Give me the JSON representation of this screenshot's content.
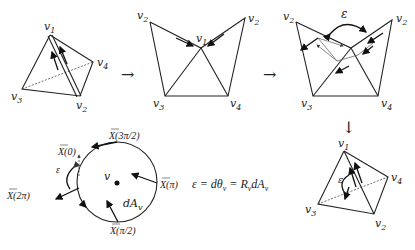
{
  "diagram": {
    "stage1_tetrahedron": {
      "vertices": [
        "v1",
        "v2",
        "v3",
        "v4"
      ],
      "labels": {
        "v1": "v",
        "v2": "v",
        "v3": "v",
        "v4": "v"
      },
      "subs": {
        "v1": "1",
        "v2": "2",
        "v3": "3",
        "v4": "4"
      }
    },
    "stage2_unfolded": {
      "labels": {
        "v2_left": "v",
        "v2_right": "v",
        "v1": "v",
        "v3": "v",
        "v4": "v"
      },
      "subs": {
        "v2_left": "2",
        "v2_right": "2",
        "v1": "1",
        "v3": "3",
        "v4": "4"
      }
    },
    "stage3_transport": {
      "labels": {
        "v2_left": "v",
        "v2_right": "v",
        "v3": "v",
        "v4": "v",
        "epsilon": "ε"
      },
      "subs": {
        "v2_left": "2",
        "v2_right": "2",
        "v3": "3",
        "v4": "4"
      }
    },
    "stage4_tetrahedron": {
      "labels": {
        "v1": "v",
        "v2": "v",
        "v3": "v",
        "v4": "v",
        "epsilon": "ε"
      },
      "subs": {
        "v1": "1",
        "v2": "2",
        "v3": "3",
        "v4": "4"
      }
    },
    "arrows": {
      "right1": "→",
      "right2": "→",
      "down": "↓"
    },
    "circle": {
      "center_label": "v",
      "area_label": "dA",
      "area_sub": "v",
      "epsilon": "ε",
      "vectors": {
        "x0": "X(0)",
        "x3pi2": "X(3π/2)",
        "xpi": "X(π)",
        "xpi2": "X(π/2)",
        "x2pi": "X(2π)"
      }
    },
    "equation": {
      "eps": "ε = dθ",
      "sub1": "v",
      "mid": " = R",
      "sub2": "v",
      "dA": "dA",
      "sub3": "v"
    }
  }
}
